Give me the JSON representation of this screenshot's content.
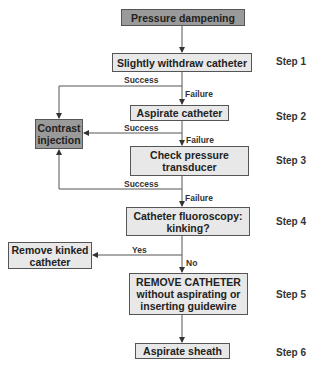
{
  "start": {
    "label": "Pressure dampening"
  },
  "nodes": {
    "withdraw": {
      "label": "Slightly withdraw catheter"
    },
    "aspirate_catheter": {
      "label": "Aspirate catheter"
    },
    "check_pressure": {
      "line1": "Check pressure",
      "line2": "transducer"
    },
    "fluoroscopy": {
      "line1": "Catheter fluoroscopy:",
      "line2": "kinking?"
    },
    "remove_catheter": {
      "line1": "REMOVE CATHETER",
      "line2": "without aspirating or",
      "line3": "inserting guidewire"
    },
    "aspirate_sheath": {
      "label": "Aspirate sheath"
    },
    "contrast": {
      "line1": "Contrast",
      "line2": "injection"
    },
    "remove_kinked": {
      "line1": "Remove kinked",
      "line2": "catheter"
    }
  },
  "edges": {
    "success1": "Success",
    "failure1": "Failure",
    "success2": "Success",
    "failure2": "Failure",
    "success3": "Success",
    "failure3": "Failure",
    "yes": "Yes",
    "no": "No"
  },
  "steps": [
    "Step 1",
    "Step 2",
    "Step 3",
    "Step 4",
    "Step 5",
    "Step 6"
  ],
  "colors": {
    "box_fill": "#e8e8e8",
    "dark_fill": "#9a9a9a",
    "line": "#555555"
  }
}
